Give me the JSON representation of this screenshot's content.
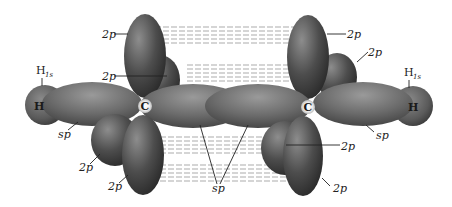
{
  "diagram": {
    "atoms": {
      "carbon_left": "C",
      "carbon_right": "C",
      "hydrogen_left": "H",
      "hydrogen_right": "H"
    },
    "labels": {
      "h1s_left_main": "H",
      "h1s_left_sub": "1s",
      "h1s_right_main": "H",
      "h1s_right_sub": "1s",
      "p_top_left_upper": "2p",
      "p_top_left_lower": "2p",
      "p_top_right_upper": "2p",
      "p_top_right_lower": "2p",
      "p_bottom_left_upper": "2p",
      "p_bottom_left_lower": "2p",
      "p_bottom_right_upper": "2p",
      "p_bottom_right_lower": "2p",
      "sp_left": "sp",
      "sp_right": "sp",
      "sp_center": "sp"
    },
    "colors": {
      "lobe_dark": "#3a3a3a",
      "lobe_mid": "#6a6a6a",
      "lobe_light": "#9a9a9a",
      "dash_lines": "#888888",
      "text": "#222222",
      "background": "#ffffff"
    }
  }
}
